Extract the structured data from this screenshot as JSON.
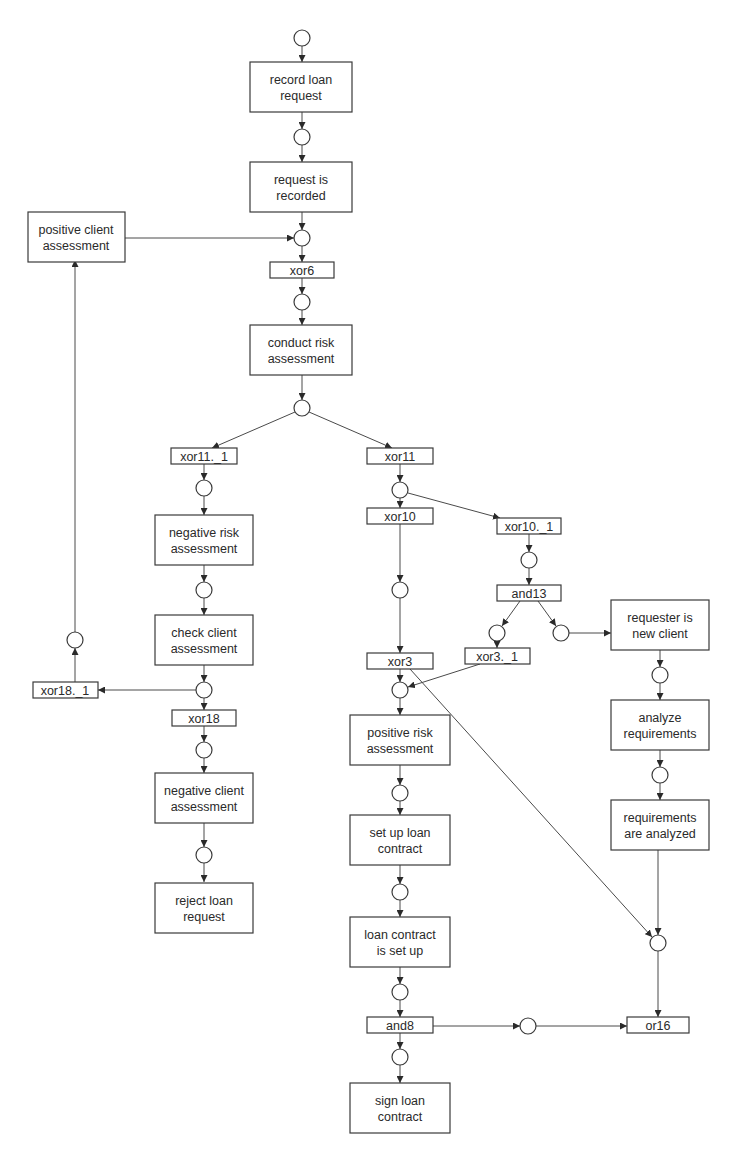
{
  "diagram": {
    "type": "EPC / Petri-net style process flow",
    "colors": {
      "stroke": "#3a3a3a",
      "background": "#ffffff",
      "text": "#2a2a2a"
    },
    "functions": {
      "record_loan_request": [
        "record loan",
        "request"
      ],
      "request_is_recorded": [
        "request is",
        "recorded"
      ],
      "positive_client_assessment": [
        "positive client",
        "assessment"
      ],
      "conduct_risk_assessment": [
        "conduct risk",
        "assessment"
      ],
      "negative_risk_assessment": [
        "negative risk",
        "assessment"
      ],
      "check_client_assessment": [
        "check client",
        "assessment"
      ],
      "negative_client_assessment": [
        "negative client",
        "assessment"
      ],
      "reject_loan_request": [
        "reject loan",
        "request"
      ],
      "positive_risk_assessment": [
        "positive risk",
        "assessment"
      ],
      "set_up_loan_contract": [
        "set up loan",
        "contract"
      ],
      "loan_contract_is_set_up": [
        "loan contract",
        "is set up"
      ],
      "sign_loan_contract": [
        "sign loan",
        "contract"
      ],
      "requester_is_new_client": [
        "requester is",
        "new client"
      ],
      "analyze_requirements": [
        "analyze",
        "requirements"
      ],
      "requirements_are_analyzed": [
        "requirements",
        "are analyzed"
      ]
    },
    "gates": {
      "xor6": "xor6",
      "xor11_1": "xor11._1",
      "xor11": "xor11",
      "xor10": "xor10",
      "xor10_1": "xor10._1",
      "and13": "and13",
      "xor3": "xor3",
      "xor3_1": "xor3._1",
      "xor18": "xor18",
      "xor18_1": "xor18._1",
      "and8": "and8",
      "or16": "or16"
    }
  }
}
